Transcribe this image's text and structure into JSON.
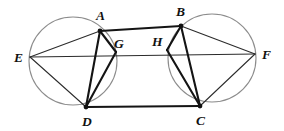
{
  "figure": {
    "type": "geometry-diagram",
    "width": 284,
    "height": 131,
    "background": "#ffffff",
    "colors": {
      "circle_stroke": "#8c8c8c",
      "chord_thin": "#2b2b2b",
      "chord_thick": "#141414",
      "vertex": "#111111",
      "label": "#111111"
    }
  },
  "points": {
    "A": {
      "label": "A",
      "x": 100,
      "y": 31,
      "label_x": 96,
      "label_y": 20,
      "dot": true
    },
    "B": {
      "label": "B",
      "x": 181,
      "y": 26,
      "label_x": 176,
      "label_y": 16,
      "dot": true
    },
    "C": {
      "label": "C",
      "x": 200,
      "y": 106,
      "label_x": 196,
      "label_y": 125,
      "dot": true
    },
    "D": {
      "label": "D",
      "x": 86,
      "y": 107,
      "label_x": 82,
      "label_y": 126,
      "dot": true
    },
    "E": {
      "label": "E",
      "x": 30,
      "y": 57,
      "label_x": 14,
      "label_y": 62,
      "dot": false
    },
    "F": {
      "label": "F",
      "x": 255,
      "y": 54,
      "label_x": 262,
      "label_y": 59,
      "dot": false
    },
    "G": {
      "label": "G",
      "x": 116,
      "y": 52,
      "label_x": 114,
      "label_y": 48,
      "dot": false
    },
    "H": {
      "label": "H",
      "x": 167,
      "y": 50,
      "label_x": 152,
      "label_y": 46,
      "dot": false
    }
  },
  "circles": [
    {
      "name": "left-circle",
      "cx": 73,
      "cy": 61,
      "r": 44
    },
    {
      "name": "right-circle",
      "cx": 212,
      "cy": 58,
      "r": 44
    }
  ],
  "segments": [
    {
      "name": "segment-EF",
      "from": "E",
      "to": "F",
      "weight": "thin"
    },
    {
      "name": "segment-EA",
      "from": "E",
      "to": "A",
      "weight": "thin"
    },
    {
      "name": "segment-ED",
      "from": "E",
      "to": "D",
      "weight": "thin"
    },
    {
      "name": "segment-FB",
      "from": "F",
      "to": "B",
      "weight": "thin"
    },
    {
      "name": "segment-FC",
      "from": "F",
      "to": "C",
      "weight": "thin"
    },
    {
      "name": "segment-AB",
      "from": "A",
      "to": "B",
      "weight": "thick"
    },
    {
      "name": "segment-DC",
      "from": "D",
      "to": "C",
      "weight": "thick"
    },
    {
      "name": "segment-AD",
      "from": "A",
      "to": "D",
      "weight": "thick"
    },
    {
      "name": "segment-AG",
      "from": "A",
      "to": "G",
      "weight": "thick"
    },
    {
      "name": "segment-GD",
      "from": "G",
      "to": "D",
      "weight": "thick"
    },
    {
      "name": "segment-BC",
      "from": "B",
      "to": "C",
      "weight": "thick"
    },
    {
      "name": "segment-BH",
      "from": "B",
      "to": "H",
      "weight": "thick"
    },
    {
      "name": "segment-HC",
      "from": "H",
      "to": "C",
      "weight": "thick"
    }
  ],
  "labels_order": [
    "A",
    "B",
    "C",
    "D",
    "E",
    "F",
    "G",
    "H"
  ]
}
